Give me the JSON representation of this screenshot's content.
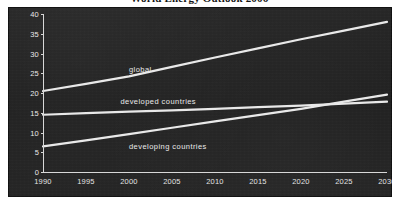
{
  "title": "World Energy Outlook 2006",
  "panel": {
    "bg_color": "#232323",
    "ink_color": "#e6e6e6"
  },
  "chart_data": {
    "type": "line",
    "title": "World Energy Outlook 2006",
    "xlabel": "",
    "ylabel": "",
    "x": [
      1990,
      1995,
      2000,
      2005,
      2010,
      2015,
      2020,
      2025,
      2030
    ],
    "xlim": [
      1990,
      2030
    ],
    "ylim": [
      0,
      40
    ],
    "xticks": [
      "1990",
      "1995",
      "2000",
      "2005",
      "2010",
      "2015",
      "2020",
      "2025",
      "2030"
    ],
    "yticks": [
      "0",
      "5",
      "10",
      "15",
      "20",
      "25",
      "30",
      "35",
      "40"
    ],
    "grid": false,
    "legend": "inline-labels",
    "series": [
      {
        "name": "global",
        "color": "#e9e9e9",
        "values": [
          20.5,
          22.3,
          24.2,
          26.6,
          29.0,
          31.3,
          33.6,
          35.8,
          38.0
        ]
      },
      {
        "name": "developed countries",
        "color": "#e9e9e9",
        "values": [
          14.5,
          14.9,
          15.3,
          15.6,
          16.0,
          16.4,
          16.8,
          17.3,
          17.8
        ]
      },
      {
        "name": "developing countries",
        "color": "#e9e9e9",
        "values": [
          6.5,
          8.0,
          9.6,
          11.2,
          12.8,
          14.4,
          16.0,
          17.8,
          19.6
        ]
      }
    ],
    "annotations": [
      {
        "text": "global",
        "x": 2000,
        "y": 25.8
      },
      {
        "text": "developed countries",
        "x": 1999,
        "y": 17.7
      },
      {
        "text": "developing countries",
        "x": 2000,
        "y": 6.4
      }
    ]
  }
}
